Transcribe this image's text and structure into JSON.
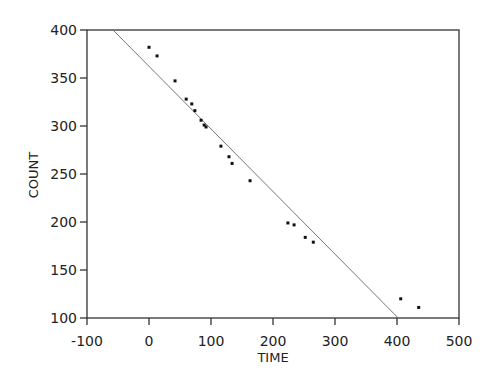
{
  "chart_data": {
    "type": "scatter",
    "title": "",
    "xlabel": "TIME",
    "ylabel": "COUNT",
    "xlim": [
      -100,
      500
    ],
    "ylim": [
      100,
      400
    ],
    "x_ticks": [
      -100,
      0,
      100,
      200,
      300,
      400,
      500
    ],
    "y_ticks": [
      100,
      150,
      200,
      250,
      300,
      350,
      400
    ],
    "x_tick_labels": [
      "-100",
      "0",
      "100",
      "200",
      "300",
      "400",
      "500"
    ],
    "y_tick_labels": [
      "100",
      "150",
      "200",
      "250",
      "300",
      "350",
      "400"
    ],
    "grid": false,
    "legend": null,
    "series": [
      {
        "name": "observations",
        "kind": "scatter",
        "x": [
          0,
          13,
          42,
          60,
          69,
          74,
          84,
          89,
          92,
          116,
          129,
          134,
          163,
          224,
          234,
          252,
          265,
          406,
          435
        ],
        "y": [
          382,
          373,
          347,
          328,
          323,
          316,
          306,
          301,
          299,
          279,
          268,
          261,
          243,
          199,
          197,
          184,
          179,
          120,
          111
        ]
      },
      {
        "name": "fitted line",
        "kind": "line",
        "x": [
          -58,
          402
        ],
        "y": [
          400,
          100
        ]
      }
    ]
  },
  "colors": {
    "axis": "#333333",
    "points": "#111111",
    "line": "#777777",
    "background": "#ffffff"
  }
}
